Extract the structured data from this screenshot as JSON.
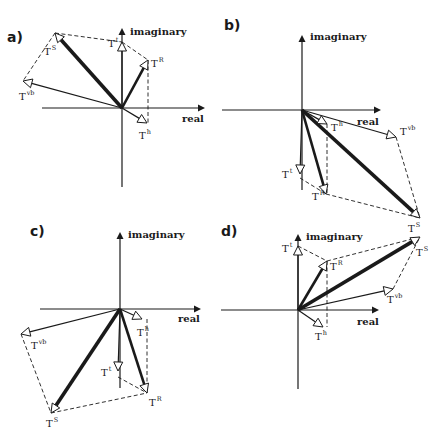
{
  "figure": {
    "width": 445,
    "height": 436,
    "ink_color": "#1a1a1a",
    "background": "#ffffff"
  },
  "chart_data": [
    {
      "type": "phasor-diagram",
      "panel": "a)",
      "axes": {
        "x_label": "real",
        "y_label": "imaginary",
        "origin": [
          122,
          108
        ],
        "x_range": [
          42,
          202
        ],
        "y_range": [
          28,
          187
        ]
      },
      "label_pos": {
        "panel": [
          7,
          42
        ],
        "imag": [
          130,
          35
        ],
        "real": [
          182,
          122
        ]
      },
      "vectors": [
        {
          "name": "T",
          "sup": "S",
          "tip": [
            55,
            33
          ],
          "weight": "heavy",
          "label": [
            44,
            55
          ]
        },
        {
          "name": "T",
          "sup": "R",
          "tip": [
            148,
            60
          ],
          "weight": "medium",
          "label": [
            151,
            67
          ]
        },
        {
          "name": "T",
          "sup": "t",
          "tip": [
            122,
            42
          ],
          "weight": "thin",
          "label": [
            108,
            47
          ]
        },
        {
          "name": "T",
          "sup": "vb",
          "tip": [
            23,
            81
          ],
          "weight": "thin",
          "label": [
            19,
            100
          ]
        },
        {
          "name": "T",
          "sup": "h",
          "tip": [
            147,
            123
          ],
          "weight": "thin",
          "label": [
            139,
            139
          ]
        }
      ],
      "dashed": [
        [
          [
            55,
            33
          ],
          [
            122,
            42
          ]
        ],
        [
          [
            122,
            42
          ],
          [
            148,
            60
          ]
        ],
        [
          [
            148,
            60
          ],
          [
            148,
            123
          ]
        ],
        [
          [
            55,
            33
          ],
          [
            23,
            81
          ]
        ]
      ]
    },
    {
      "type": "phasor-diagram",
      "panel": "b)",
      "axes": {
        "x_label": "real",
        "y_label": "imaginary",
        "origin": [
          302,
          110
        ],
        "x_range": [
          222,
          378
        ],
        "y_range": [
          35,
          190
        ]
      },
      "label_pos": {
        "panel": [
          224,
          30
        ],
        "imag": [
          310,
          40
        ],
        "real": [
          357,
          125
        ]
      },
      "vectors": [
        {
          "name": "T",
          "sup": "S",
          "tip": [
            420,
            218
          ],
          "weight": "heavy",
          "label": [
            408,
            232
          ]
        },
        {
          "name": "T",
          "sup": "R",
          "tip": [
            326,
            194
          ],
          "weight": "medium",
          "label": [
            312,
            200
          ]
        },
        {
          "name": "T",
          "sup": "t",
          "tip": [
            300,
            174
          ],
          "weight": "thin",
          "label": [
            282,
            178
          ]
        },
        {
          "name": "T",
          "sup": "vb",
          "tip": [
            396,
            137
          ],
          "weight": "thin",
          "label": [
            400,
            135
          ]
        },
        {
          "name": "T",
          "sup": "h",
          "tip": [
            327,
            124
          ],
          "weight": "thin",
          "label": [
            331,
            131
          ]
        }
      ],
      "dashed": [
        [
          [
            300,
            178
          ],
          [
            326,
            194
          ]
        ],
        [
          [
            326,
            194
          ],
          [
            420,
            218
          ]
        ],
        [
          [
            396,
            137
          ],
          [
            420,
            218
          ]
        ],
        [
          [
            327,
            124
          ],
          [
            327,
            194
          ]
        ]
      ]
    },
    {
      "type": "phasor-diagram",
      "panel": "c)",
      "axes": {
        "x_label": "real",
        "y_label": "imaginary",
        "origin": [
          120,
          309
        ],
        "x_range": [
          40,
          198
        ],
        "y_range": [
          232,
          388
        ]
      },
      "label_pos": {
        "panel": [
          30,
          236
        ],
        "imag": [
          128,
          238
        ],
        "real": [
          178,
          322
        ]
      },
      "vectors": [
        {
          "name": "T",
          "sup": "S",
          "tip": [
            51,
            413
          ],
          "weight": "heavy",
          "label": [
            46,
            427
          ]
        },
        {
          "name": "T",
          "sup": "R",
          "tip": [
            147,
            393
          ],
          "weight": "medium",
          "label": [
            149,
            406
          ]
        },
        {
          "name": "T",
          "sup": "t",
          "tip": [
            118,
            371
          ],
          "weight": "thin",
          "label": [
            101,
            376
          ]
        },
        {
          "name": "T",
          "sup": "vb",
          "tip": [
            21,
            334
          ],
          "weight": "thin",
          "label": [
            31,
            349
          ]
        },
        {
          "name": "T",
          "sup": "h",
          "tip": [
            142,
            319
          ],
          "weight": "thin",
          "label": [
            137,
            336
          ]
        }
      ],
      "dashed": [
        [
          [
            21,
            334
          ],
          [
            51,
            413
          ]
        ],
        [
          [
            51,
            413
          ],
          [
            147,
            393
          ]
        ],
        [
          [
            118,
            377
          ],
          [
            147,
            393
          ]
        ],
        [
          [
            147,
            319
          ],
          [
            147,
            393
          ]
        ]
      ]
    },
    {
      "type": "phasor-diagram",
      "panel": "d)",
      "axes": {
        "x_label": "real",
        "y_label": "imaginary",
        "origin": [
          298,
          310
        ],
        "x_range": [
          221,
          376
        ],
        "y_range": [
          234,
          389
        ]
      },
      "label_pos": {
        "panel": [
          221,
          236
        ],
        "imag": [
          306,
          240
        ],
        "real": [
          357,
          325
        ]
      },
      "vectors": [
        {
          "name": "T",
          "sup": "S",
          "tip": [
            420,
            237
          ],
          "weight": "heavy",
          "label": [
            416,
            256
          ]
        },
        {
          "name": "T",
          "sup": "R",
          "tip": [
            327,
            261
          ],
          "weight": "medium",
          "label": [
            330,
            270
          ]
        },
        {
          "name": "T",
          "sup": "t",
          "tip": [
            298,
            246
          ],
          "weight": "thin",
          "label": [
            282,
            252
          ]
        },
        {
          "name": "T",
          "sup": "vb",
          "tip": [
            393,
            289
          ],
          "weight": "thin",
          "label": [
            387,
            303
          ]
        },
        {
          "name": "T",
          "sup": "h",
          "tip": [
            323,
            327
          ],
          "weight": "thin",
          "label": [
            315,
            340
          ]
        }
      ],
      "dashed": [
        [
          [
            298,
            246
          ],
          [
            327,
            261
          ]
        ],
        [
          [
            327,
            261
          ],
          [
            420,
            237
          ]
        ],
        [
          [
            393,
            289
          ],
          [
            420,
            237
          ]
        ],
        [
          [
            327,
            261
          ],
          [
            327,
            327
          ]
        ]
      ]
    }
  ],
  "legend": {
    "vector_names": [
      "T^S",
      "T^R",
      "T^t",
      "T^vb",
      "T^h"
    ]
  }
}
